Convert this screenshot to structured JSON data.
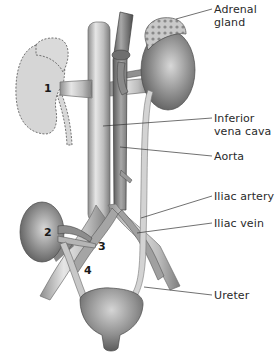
{
  "diagram": {
    "labels": [
      {
        "id": "adrenal-gland",
        "text": "Adrenal\ngland",
        "x": 214,
        "y": 3
      },
      {
        "id": "inferior-vena-cava",
        "text": "Inferior\nvena cava",
        "x": 214,
        "y": 112
      },
      {
        "id": "aorta",
        "text": "Aorta",
        "x": 214,
        "y": 150
      },
      {
        "id": "iliac-artery",
        "text": "Iliac artery",
        "x": 214,
        "y": 190
      },
      {
        "id": "iliac-vein",
        "text": "Iliac vein",
        "x": 214,
        "y": 217
      },
      {
        "id": "ureter",
        "text": "Ureter",
        "x": 214,
        "y": 289
      }
    ],
    "markers": [
      {
        "id": "marker-1",
        "text": "1",
        "x": 44,
        "y": 82
      },
      {
        "id": "marker-2",
        "text": "2",
        "x": 44,
        "y": 228
      },
      {
        "id": "marker-3",
        "text": "3",
        "x": 98,
        "y": 240
      },
      {
        "id": "marker-4",
        "text": "4",
        "x": 84,
        "y": 265
      }
    ],
    "colors": {
      "background": "#ffffff",
      "organ_dark": "#7a7a7a",
      "organ_light": "#d0d0d0",
      "ghost_kidney": "#d6d6d6",
      "vessel": "#bdbdbd",
      "vessel_dark": "#8a8a8a",
      "leader_line": "#333333",
      "text": "#2a2a2a"
    }
  }
}
